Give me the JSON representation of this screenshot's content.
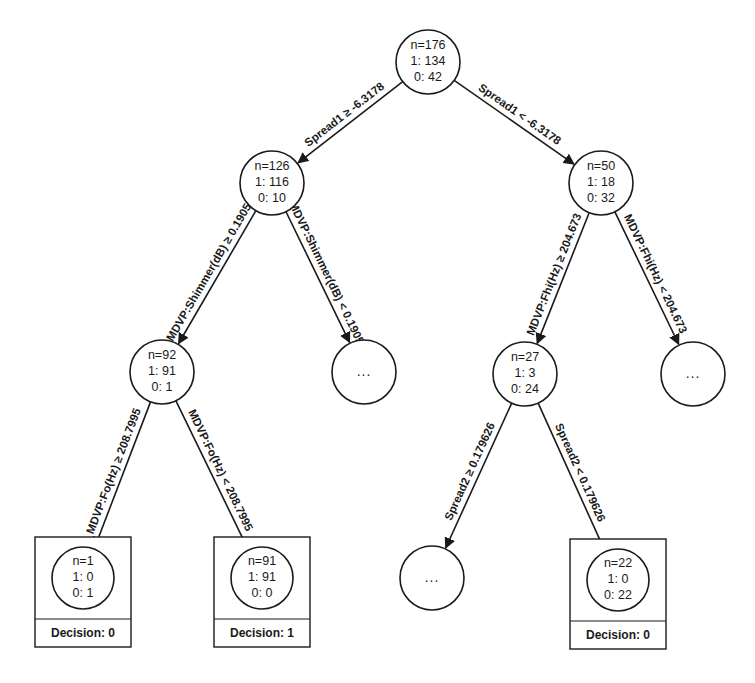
{
  "diagram": {
    "type": "decision-tree",
    "nodes": [
      {
        "id": "root",
        "n": "n=176",
        "c1": "1: 134",
        "c0": "0: 42",
        "leaf": false
      },
      {
        "id": "l",
        "n": "n=126",
        "c1": "1: 116",
        "c0": "0: 10",
        "leaf": false
      },
      {
        "id": "r",
        "n": "n=50",
        "c1": "1: 18",
        "c0": "0: 32",
        "leaf": false
      },
      {
        "id": "ll",
        "n": "n=92",
        "c1": "1: 91",
        "c0": "0: 1",
        "leaf": false
      },
      {
        "id": "lr",
        "ellipsis": "...",
        "leaf": false
      },
      {
        "id": "rl",
        "n": "n=27",
        "c1": "1: 3",
        "c0": "0: 24",
        "leaf": false
      },
      {
        "id": "rr",
        "ellipsis": "...",
        "leaf": false
      },
      {
        "id": "lll",
        "n": "n=1",
        "c1": "1: 0",
        "c0": "0: 1",
        "leaf": true,
        "decision": "Decision: 0"
      },
      {
        "id": "llr",
        "n": "n=91",
        "c1": "1: 91",
        "c0": "0: 0",
        "leaf": true,
        "decision": "Decision: 1"
      },
      {
        "id": "rll",
        "ellipsis": "...",
        "leaf": false
      },
      {
        "id": "rlr",
        "n": "n=22",
        "c1": "1: 0",
        "c0": "0: 22",
        "leaf": true,
        "decision": "Decision: 0"
      }
    ],
    "edges": [
      {
        "from": "root",
        "to": "l",
        "label": "Spread1 ≥ -6.3178"
      },
      {
        "from": "root",
        "to": "r",
        "label": "Spread1 < -6.3178"
      },
      {
        "from": "l",
        "to": "ll",
        "label": "MDVP:Shimmer(dB) ≥ 0.1905"
      },
      {
        "from": "l",
        "to": "lr",
        "label": "MDVP:Shimmer(dB) < 0.1905"
      },
      {
        "from": "r",
        "to": "rl",
        "label": "MDVP:Fhi(Hz) ≥ 204.673"
      },
      {
        "from": "r",
        "to": "rr",
        "label": "MDVP:Fhi(Hz) < 204.673"
      },
      {
        "from": "ll",
        "to": "lll",
        "label": "MDVP:Fo(Hz) ≥ 208.7995"
      },
      {
        "from": "ll",
        "to": "llr",
        "label": "MDVP:Fo(Hz) < 208.7995"
      },
      {
        "from": "rl",
        "to": "rll",
        "label": "Spread2 ≥ 0.179626"
      },
      {
        "from": "rl",
        "to": "rlr",
        "label": "Spread2 < 0.179626"
      }
    ]
  }
}
